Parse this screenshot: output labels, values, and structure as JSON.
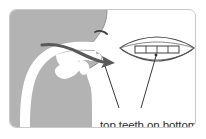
{
  "figure": {
    "name": "articulation-diagram",
    "caption": "top teeth on bottom lip",
    "description_title": "Sagittal head cross-section with front mouth view",
    "colors": {
      "head_fill": "#b3b3b3",
      "vocal_tract_fill": "#ffffff",
      "outline": "#4d4d4d",
      "arrow": "#595959",
      "leader_line": "#3a3a3a",
      "frame_border": "#c9c9c9",
      "background": "#ffffff",
      "text": "#2b2b2b"
    },
    "parts": {
      "head_profile": "head-profile-shape",
      "nose": "nose-profile",
      "nostril": "nostril-mark",
      "lips_profile": "lips-profile",
      "oral_cavity": "oral-cavity",
      "pharynx": "pharyngeal-cavity",
      "tongue": "tongue-shape",
      "soft_palate": "soft-palate-shape",
      "airflow_arrow": "airflow-arrow",
      "mouth_front": "front-mouth-outline",
      "upper_teeth": "upper-teeth-band",
      "tooth_divider_count": 3,
      "leader_left": "leader-line-left",
      "leader_right": "leader-line-right"
    }
  }
}
